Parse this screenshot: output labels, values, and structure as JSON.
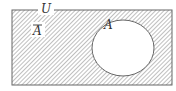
{
  "diagram": {
    "type": "venn",
    "universe_label": "U",
    "set_label": "A",
    "complement_label": "A",
    "complement_has_overline": true,
    "shaded_region": "complement of A",
    "colors": {
      "border": "#666666",
      "hatch": "#8a8a8a",
      "background": "#ffffff",
      "text": "#333333"
    }
  }
}
